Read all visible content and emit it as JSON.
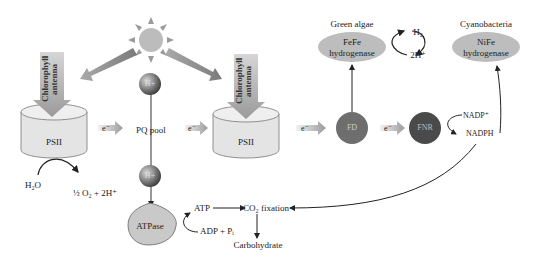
{
  "diagram": {
    "nodes": {
      "sun": {
        "label": ""
      },
      "antenna1": {
        "label": "Chlorophyll antenna"
      },
      "antenna2": {
        "label": "Chlorophyll antenna"
      },
      "psii_1": {
        "label": "PSII"
      },
      "psii_2": {
        "label": "PSII"
      },
      "pq_pool": {
        "label": "PQ pool"
      },
      "h_plus_top": {
        "label": "H+"
      },
      "h_plus_bottom": {
        "label": "H+"
      },
      "atpase": {
        "label": "ATPase"
      },
      "fd": {
        "label": "FD"
      },
      "fnr": {
        "label": "FNR"
      },
      "fefe": {
        "label_line1": "FeFe",
        "label_line2": "hydrogenase",
        "group": "Green algae"
      },
      "nife": {
        "label_line1": "NiFe",
        "label_line2": "hydrogenase",
        "group": "Cyanobacteria"
      }
    },
    "labels": {
      "electron": "e⁻",
      "h2o": "H₂O",
      "o2": "½ O₂ + 2H⁺",
      "atp": "ATP",
      "adp": "ADP + Pᵢ",
      "co2": "CO₂ fixation",
      "carbohydrate": "Carbohydrate",
      "h2": "H₂",
      "two_h": "2H⁺",
      "nadp": "NADP⁺",
      "nadph": "NADPH"
    },
    "colors": {
      "sun": "#b8b8b8",
      "light_arrow": "#8c8c8c",
      "cylinder": "#e2e2e2",
      "ellipse": "#bdbdbd",
      "fd": "#6e6e6e",
      "fnr": "#4a4a4a",
      "atpase": "#c8c8c8"
    }
  }
}
